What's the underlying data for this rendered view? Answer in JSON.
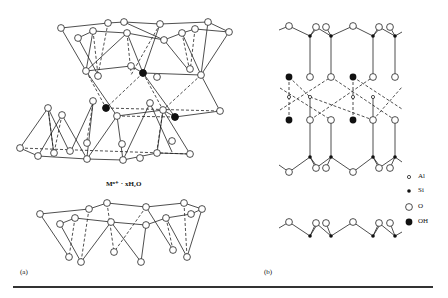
{
  "figure": {
    "panel_a": {
      "label": "(a)",
      "interlayer_label": "Mⁿ⁺ · xH₂O",
      "description": "Perspective view of 2:1 layer silicate: tetrahedral sheet, octahedral sheet, tetrahedral sheet, interlayer cations with water, next tetrahedral sheet"
    },
    "panel_b": {
      "label": "(b)",
      "description": "Side projection of 2:1 layer showing Si tetrahedral sheets bonded to central Al octahedral sheet with OH groups"
    },
    "legend": [
      {
        "symbol": "small-open-circle",
        "label": "Al"
      },
      {
        "symbol": "small-filled-circle",
        "label": "Si"
      },
      {
        "symbol": "large-open-circle",
        "label": "O"
      },
      {
        "symbol": "large-filled-circle",
        "label": "OH"
      }
    ],
    "colors": {
      "line": "#222222",
      "fill_dark": "#111111",
      "background": "#ffffff"
    }
  }
}
